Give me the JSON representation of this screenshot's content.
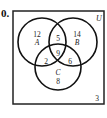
{
  "problem": {
    "number_label": "0."
  },
  "diagram": {
    "universe_label": "U",
    "sets": [
      {
        "name": "A",
        "label": "A"
      },
      {
        "name": "B",
        "label": "B"
      },
      {
        "name": "C",
        "label": "C"
      }
    ],
    "regions": {
      "A_only": "12",
      "B_only": "14",
      "A_and_B_only": "5",
      "A_and_B_and_C": "9",
      "A_and_C_only": "2",
      "B_and_C_only": "6",
      "C_only": "8",
      "outside": "3"
    }
  }
}
